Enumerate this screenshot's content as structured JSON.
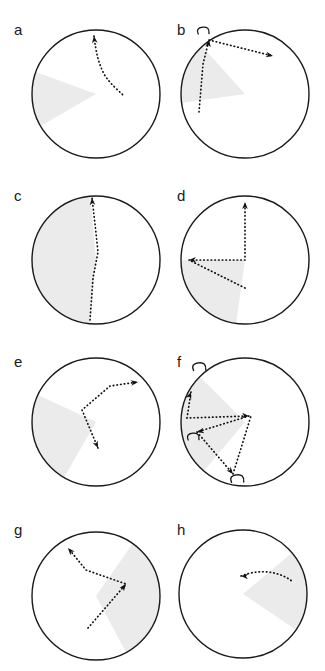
{
  "figure": {
    "type": "multi-panel-circular-trajectory-plot",
    "panel_count": 8,
    "columns": 2,
    "rows": 4,
    "background_color": "#ffffff",
    "circle_stroke_color": "#1a1a1a",
    "sector_fill_color": "#ebebeb",
    "trajectory_color": "#111111",
    "label_color": "#1a1a1a"
  },
  "chart_data": {
    "type": "scatter",
    "title": "",
    "xlabel": "",
    "ylabel": "",
    "grid": false,
    "legend": null,
    "panels": [
      {
        "label": "a",
        "circle": {
          "cx": 96,
          "cy": 94,
          "r": 64
        },
        "sector": {
          "start_deg": 150,
          "end_deg": 200,
          "fill": "#ebebeb"
        },
        "path": "M 94,36 C 96,52 98,62 104,74 C 110,84 118,90 124,96",
        "arrows": [
          {
            "x": 94,
            "y": 36,
            "angle_deg": -96
          }
        ],
        "hooks": []
      },
      {
        "label": "b",
        "circle": {
          "cx": 82,
          "cy": 94,
          "r": 64
        },
        "sector": {
          "start_deg": 172,
          "end_deg": 228,
          "fill": "#ebebeb"
        },
        "path": "M 36,112 L 40,64 L 46,40 M 46,40 L 110,56",
        "arrows": [
          {
            "x": 46,
            "y": 40,
            "angle_deg": -82
          },
          {
            "x": 110,
            "y": 56,
            "angle_deg": 12
          }
        ],
        "hooks": [
          {
            "x": 40,
            "y": 30,
            "size": 8
          }
        ]
      },
      {
        "label": "c",
        "circle": {
          "cx": 96,
          "cy": 94,
          "r": 64
        },
        "sector": {
          "start_deg": 95,
          "end_deg": 265,
          "fill": "#ebebeb"
        },
        "path": "M 90,154 L 93,112 L 98,86 L 95,58 L 92,32",
        "arrows": [
          {
            "x": 92,
            "y": 32,
            "angle_deg": -94
          }
        ],
        "hooks": []
      },
      {
        "label": "d",
        "circle": {
          "cx": 82,
          "cy": 94,
          "r": 64
        },
        "sector": {
          "start_deg": 98,
          "end_deg": 180,
          "fill": "#ebebeb"
        },
        "path": "M 82,122 L 26,94 M 26,94 L 82,94 L 82,36",
        "arrows": [
          {
            "x": 26,
            "y": 94,
            "angle_deg": 178
          },
          {
            "x": 82,
            "y": 36,
            "angle_deg": -90
          }
        ],
        "hooks": []
      },
      {
        "label": "e",
        "circle": {
          "cx": 96,
          "cy": 90,
          "r": 64
        },
        "sector": {
          "start_deg": 120,
          "end_deg": 205,
          "fill": "#ebebeb"
        },
        "path": "M 98,116 L 82,78 L 110,54 L 138,50",
        "arrows": [
          {
            "x": 98,
            "y": 116,
            "angle_deg": 66
          },
          {
            "x": 138,
            "y": 50,
            "angle_deg": -8
          }
        ],
        "hooks": []
      },
      {
        "label": "f",
        "circle": {
          "cx": 82,
          "cy": 90,
          "r": 64
        },
        "sector": {
          "start_deg": 130,
          "end_deg": 225,
          "fill": "#ebebeb"
        },
        "path": "M 28,60 L 24,86 L 86,84 M 86,84 L 34,100 M 34,100 L 70,142 M 70,142 L 88,84",
        "arrows": [
          {
            "x": 28,
            "y": 60,
            "angle_deg": -70
          },
          {
            "x": 86,
            "y": 84,
            "angle_deg": 4
          },
          {
            "x": 34,
            "y": 100,
            "angle_deg": 168
          },
          {
            "x": 70,
            "y": 142,
            "angle_deg": 50
          }
        ],
        "hooks": [
          {
            "x": 36,
            "y": 34,
            "size": 9
          },
          {
            "x": 30,
            "y": 104,
            "size": 8
          },
          {
            "x": 74,
            "y": 146,
            "size": 9
          }
        ]
      },
      {
        "label": "g",
        "circle": {
          "cx": 96,
          "cy": 96,
          "r": 64
        },
        "sector": {
          "start_deg": -55,
          "end_deg": 62,
          "fill": "#ebebeb"
        },
        "path": "M 88,128 L 126,84 L 86,70 L 68,48",
        "arrows": [
          {
            "x": 126,
            "y": 84,
            "angle_deg": -52
          },
          {
            "x": 68,
            "y": 48,
            "angle_deg": -130
          }
        ],
        "hooks": []
      },
      {
        "label": "h",
        "circle": {
          "cx": 80,
          "cy": 94,
          "r": 64
        },
        "sector": {
          "start_deg": -40,
          "end_deg": 34,
          "fill": "#ebebeb"
        },
        "path": "M 78,76 C 98,68 118,72 130,82",
        "arrows": [
          {
            "x": 78,
            "y": 76,
            "angle_deg": 184
          }
        ],
        "hooks": []
      }
    ]
  }
}
